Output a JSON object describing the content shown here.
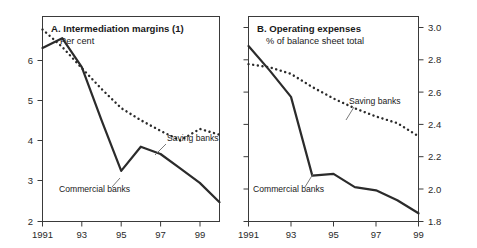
{
  "figure": {
    "background": "#ffffff",
    "ink_color": "#2b2b2b"
  },
  "panels": [
    {
      "id": "A",
      "title": "A. Intermediation margins (1)",
      "subtitle": "Per cent",
      "axis_side": "left",
      "xticklabels": [
        "1991",
        "93",
        "95",
        "97",
        "99"
      ],
      "yticklabels": [
        "2",
        "3",
        "4",
        "5",
        "6"
      ],
      "labels": {
        "saving": "Saving banks",
        "commercial": "Commercial banks"
      }
    },
    {
      "id": "B",
      "title": "B. Operating expenses",
      "subtitle": "% of balance sheet total",
      "axis_side": "right",
      "xticklabels": [
        "1991",
        "93",
        "95",
        "97",
        "99"
      ],
      "yticklabels": [
        "1.8",
        "2.0",
        "2.2",
        "2.4",
        "2.6",
        "2.8",
        "3.0"
      ],
      "labels": {
        "saving": "Saving banks",
        "commercial": "Commercial banks"
      }
    }
  ],
  "chart_data": [
    {
      "type": "line",
      "panel": "A",
      "title": "A. Intermediation margins (1)",
      "subtitle": "Per cent",
      "xlabel": "",
      "ylabel": "Per cent",
      "x": [
        1991,
        1992,
        1993,
        1994,
        1995,
        1996,
        1997,
        1998,
        1999,
        2000
      ],
      "xticks": [
        1991,
        1993,
        1995,
        1997,
        1999
      ],
      "xticklabels": [
        "1991",
        "93",
        "95",
        "97",
        "99"
      ],
      "yticks": [
        2,
        3,
        4,
        5,
        6
      ],
      "xlim": [
        1991,
        2000
      ],
      "ylim": [
        2,
        6
      ],
      "grid": false,
      "legend": "inline-annotations",
      "series": [
        {
          "name": "Commercial banks",
          "style": "solid",
          "values": [
            5.6,
            5.8,
            5.2,
            4.1,
            3.05,
            3.55,
            3.4,
            3.1,
            2.8,
            2.4
          ]
        },
        {
          "name": "Saving banks",
          "style": "dotted",
          "values": [
            5.98,
            5.62,
            5.18,
            4.75,
            4.35,
            4.1,
            3.88,
            3.68,
            3.92,
            3.8
          ]
        }
      ]
    },
    {
      "type": "line",
      "panel": "B",
      "title": "B. Operating expenses",
      "subtitle": "% of balance sheet total",
      "xlabel": "",
      "ylabel": "% of balance sheet total",
      "x": [
        1991,
        1992,
        1993,
        1994,
        1995,
        1996,
        1997,
        1998,
        1999
      ],
      "xticks": [
        1991,
        1993,
        1995,
        1997,
        1999
      ],
      "xticklabels": [
        "1991",
        "93",
        "95",
        "97",
        "99"
      ],
      "yticks": [
        1.8,
        2.0,
        2.2,
        2.4,
        2.6,
        2.8,
        3.0
      ],
      "xlim": [
        1991,
        1999
      ],
      "ylim": [
        1.8,
        3.0
      ],
      "grid": false,
      "legend": "inline-annotations",
      "series": [
        {
          "name": "Commercial banks",
          "style": "solid",
          "values": [
            2.87,
            2.72,
            2.56,
            2.08,
            2.09,
            2.01,
            1.99,
            1.93,
            1.85
          ]
        },
        {
          "name": "Saving banks",
          "style": "dotted",
          "values": [
            2.76,
            2.74,
            2.7,
            2.62,
            2.55,
            2.49,
            2.44,
            2.4,
            2.32
          ]
        }
      ]
    }
  ]
}
